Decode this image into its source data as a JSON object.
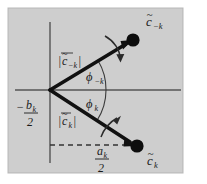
{
  "figure": {
    "name": "phasor-diagram-complex-fourier-coefficients",
    "type": "vector-diagram",
    "background_color": "#d2d2d2",
    "frame_color": "#b4b4b4",
    "axis_color": "#555555",
    "vector_color": "#111111",
    "dashed_color": "#333333",
    "canvas": {
      "width": 207,
      "height": 184
    }
  },
  "axes": {
    "vertical": {
      "x": 50,
      "y1": 22,
      "y2": 163,
      "label": "imaginary-axis"
    },
    "horizontal": {
      "y": 90,
      "x1": 15,
      "x2": 181,
      "label": "real-axis"
    },
    "origin": {
      "x": 50,
      "y": 90
    }
  },
  "labels": {
    "upper_vector_tip": {
      "base": "c",
      "tilde": "~",
      "sub": "−k",
      "x": 150,
      "y": 24
    },
    "lower_vector_tip": {
      "base": "c",
      "tilde": "~",
      "sub": "k",
      "x": 150,
      "y": 163
    },
    "upper_magnitude": {
      "text": "|c̃−k|",
      "base": "c",
      "sub": "−k",
      "x": 70,
      "y": 62
    },
    "lower_magnitude": {
      "text": "|c̃k|",
      "base": "c",
      "sub": "k",
      "x": 70,
      "y": 122
    },
    "upper_angle": {
      "base": "ϕ",
      "sub": "−k",
      "x": 95,
      "y": 78
    },
    "lower_angle": {
      "base": "ϕ",
      "sub": "k",
      "x": 95,
      "y": 105
    },
    "left_axis_value": {
      "sign": "−",
      "numerator_base": "b",
      "numerator_sub": "k",
      "denominator": "2",
      "x": 26,
      "y": 112
    },
    "bottom_axis_value": {
      "numerator_base": "a",
      "numerator_sub": "k",
      "denominator": "2",
      "x": 106,
      "y": 153
    }
  },
  "vectors": [
    {
      "name": "upper-phasor",
      "label": "c-tilde-minus-k",
      "from": {
        "x": 50,
        "y": 90
      },
      "to": {
        "x": 131,
        "y": 41
      },
      "tip_dot_radius": 6.5,
      "angle_deg": 31.2,
      "rotation_direction": "clockwise"
    },
    {
      "name": "lower-phasor",
      "label": "c-tilde-k",
      "from": {
        "x": 50,
        "y": 90
      },
      "to": {
        "x": 135,
        "y": 145
      },
      "tip_dot_radius": 6.5,
      "angle_deg": -32.9,
      "rotation_direction": "counter-clockwise"
    }
  ],
  "arcs": [
    {
      "name": "upper-angle-arc",
      "radius": 56,
      "start_deg": 0,
      "end_deg": 31.2
    },
    {
      "name": "lower-angle-arc",
      "radius": 56,
      "start_deg": 0,
      "end_deg": -32.9
    }
  ],
  "rotation_arrows": [
    {
      "name": "upper-rotation-arrow",
      "direction": "clockwise",
      "x": 118,
      "y": 48
    },
    {
      "name": "lower-rotation-arrow",
      "direction": "counter-clockwise",
      "x": 112,
      "y": 128
    }
  ],
  "dashed_line": {
    "name": "projection-guide-line",
    "from": {
      "x": 50,
      "y": 145
    },
    "to": {
      "x": 132,
      "y": 145
    }
  }
}
